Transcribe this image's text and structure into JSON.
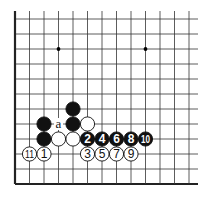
{
  "diagram": {
    "type": "go-board-fragment",
    "board": {
      "columns": 13,
      "rows": 12,
      "origin_x": 15,
      "origin_y": 19,
      "spacing_x": 14.5,
      "spacing_y": 15,
      "left_edge": true,
      "bottom_edge": true,
      "line_color": "#333333",
      "edge_color": "#222222"
    },
    "star_points": [
      {
        "col": 3,
        "row": 2
      },
      {
        "col": 9,
        "row": 2
      }
    ],
    "stones": [
      {
        "col": 4,
        "row": 6,
        "color": "black",
        "label": ""
      },
      {
        "col": 2,
        "row": 7,
        "color": "black",
        "label": ""
      },
      {
        "col": 4,
        "row": 7,
        "color": "black",
        "label": ""
      },
      {
        "col": 5,
        "row": 7,
        "color": "white",
        "label": ""
      },
      {
        "col": 2,
        "row": 8,
        "color": "black",
        "label": ""
      },
      {
        "col": 3,
        "row": 8,
        "color": "white",
        "label": ""
      },
      {
        "col": 4,
        "row": 8,
        "color": "white",
        "label": ""
      },
      {
        "col": 5,
        "row": 8,
        "color": "black",
        "label": "2"
      },
      {
        "col": 6,
        "row": 8,
        "color": "black",
        "label": "4"
      },
      {
        "col": 7,
        "row": 8,
        "color": "black",
        "label": "6"
      },
      {
        "col": 8,
        "row": 8,
        "color": "black",
        "label": "8"
      },
      {
        "col": 9,
        "row": 8,
        "color": "black",
        "label": "10"
      },
      {
        "col": 1,
        "row": 9,
        "color": "white",
        "label": "11"
      },
      {
        "col": 2,
        "row": 9,
        "color": "white",
        "label": "1"
      },
      {
        "col": 5,
        "row": 9,
        "color": "white",
        "label": "3"
      },
      {
        "col": 6,
        "row": 9,
        "color": "white",
        "label": "5"
      },
      {
        "col": 7,
        "row": 9,
        "color": "white",
        "label": "7"
      },
      {
        "col": 8,
        "row": 9,
        "color": "white",
        "label": "9"
      }
    ],
    "markers": [
      {
        "col": 3,
        "row": 7,
        "label": "a"
      }
    ]
  }
}
